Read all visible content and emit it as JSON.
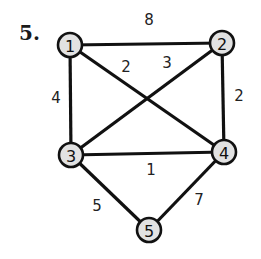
{
  "problem": {
    "number_label": "5."
  },
  "colors": {
    "node_fill": "#e2e2e2",
    "stroke": "#111111",
    "background": "#ffffff"
  },
  "graph": {
    "nodes": [
      {
        "id": "1",
        "label": "1",
        "x": 70,
        "y": 45
      },
      {
        "id": "2",
        "label": "2",
        "x": 222,
        "y": 43
      },
      {
        "id": "3",
        "label": "3",
        "x": 71,
        "y": 155
      },
      {
        "id": "4",
        "label": "4",
        "x": 224,
        "y": 152
      },
      {
        "id": "5",
        "label": "5",
        "x": 149,
        "y": 230
      }
    ],
    "edges": [
      {
        "from": "1",
        "to": "2",
        "weight": "8",
        "label_x": 149,
        "label_y": 20
      },
      {
        "from": "1",
        "to": "3",
        "weight": "4",
        "label_x": 56,
        "label_y": 98
      },
      {
        "from": "1",
        "to": "4",
        "weight": "2",
        "label_x": 126,
        "label_y": 67
      },
      {
        "from": "2",
        "to": "3",
        "weight": "3",
        "label_x": 167,
        "label_y": 63
      },
      {
        "from": "2",
        "to": "4",
        "weight": "2",
        "label_x": 239,
        "label_y": 96
      },
      {
        "from": "3",
        "to": "4",
        "weight": "1",
        "label_x": 151,
        "label_y": 170
      },
      {
        "from": "3",
        "to": "5",
        "weight": "5",
        "label_x": 97,
        "label_y": 206
      },
      {
        "from": "4",
        "to": "5",
        "weight": "7",
        "label_x": 199,
        "label_y": 200
      }
    ],
    "node_radius": 12
  }
}
